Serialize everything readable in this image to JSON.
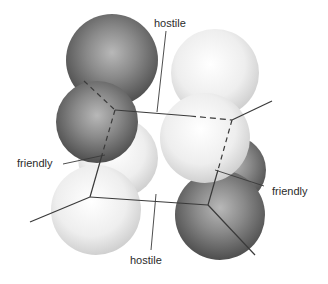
{
  "diagram": {
    "labels": {
      "top_hostile": "hostile",
      "left_friendly": "friendly",
      "right_friendly": "friendly",
      "bottom_hostile": "hostile"
    },
    "colors": {
      "dark_sphere": "#5a5a5a",
      "light_sphere": "#f2f2f2",
      "line": "#3a3a3a",
      "text": "#2b2b2b",
      "background": "#ffffff"
    },
    "spheres": [
      {
        "id": "dark-top-upper",
        "tone": "dark"
      },
      {
        "id": "dark-top-lower",
        "tone": "dark"
      },
      {
        "id": "light-left-upper",
        "tone": "light"
      },
      {
        "id": "light-left-lower",
        "tone": "light"
      },
      {
        "id": "light-right-upper",
        "tone": "light"
      },
      {
        "id": "light-right-lower",
        "tone": "light"
      },
      {
        "id": "dark-right-upper",
        "tone": "dark"
      },
      {
        "id": "dark-right-lower",
        "tone": "dark"
      }
    ]
  }
}
